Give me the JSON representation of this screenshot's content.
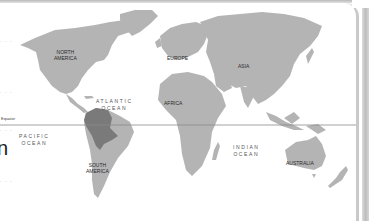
{
  "map": {
    "title": "World Map",
    "colors": {
      "land": "#b4b4b4",
      "highlight": "#7a7a7a",
      "equator": "#8a8a8a",
      "background": "#ffffff",
      "frame": "#c9c9c9"
    },
    "equator_label": "Equator",
    "continents": [
      {
        "id": "north-america",
        "label_line1": "NORTH",
        "label_line2": "AMERICA"
      },
      {
        "id": "south-america",
        "label_line1": "SOUTH",
        "label_line2": "AMERICA"
      },
      {
        "id": "europe",
        "label_line1": "EUROPE"
      },
      {
        "id": "africa",
        "label_line1": "AFRICA"
      },
      {
        "id": "asia",
        "label_line1": "ASIA"
      },
      {
        "id": "australia",
        "label_line1": "AUSTRALIA"
      }
    ],
    "oceans": [
      {
        "id": "atlantic",
        "label_line1": "ATLANTIC",
        "label_line2": "OCEAN"
      },
      {
        "id": "pacific",
        "label_line1": "PACIFIC",
        "label_line2": "OCEAN"
      },
      {
        "id": "indian",
        "label_line1": "INDIAN",
        "label_line2": "OCEAN"
      }
    ],
    "highlighted_region": "Amazon basin (northern South America)",
    "edge_text": "n",
    "edge_dots": "· · ·"
  }
}
